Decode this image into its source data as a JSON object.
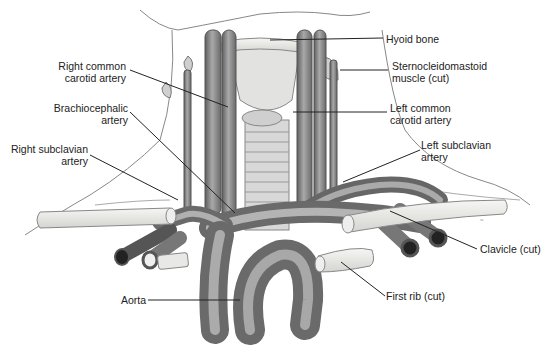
{
  "figure": {
    "labels": {
      "right_common_carotid": [
        "Right common",
        "carotid artery"
      ],
      "brachiocephalic": [
        "Brachiocephalic",
        "artery"
      ],
      "right_subclavian": [
        "Right subclavian",
        "artery"
      ],
      "aorta": [
        "Aorta"
      ],
      "hyoid": [
        "Hyoid bone"
      ],
      "sternocleidomastoid": [
        "Sternocleidomastoid",
        "muscle (cut)"
      ],
      "left_common_carotid": [
        "Left common",
        "carotid artery"
      ],
      "left_subclavian": [
        "Left subclavian",
        "artery"
      ],
      "clavicle": [
        "Clavicle (cut)"
      ],
      "first_rib": [
        "First rib (cut)"
      ]
    },
    "colors": {
      "vessel": "#8a8a8a",
      "vessel_dark": "#5a5a5a",
      "bone": "#ececec",
      "skin_line": "#777777",
      "leader": "#222222",
      "text": "#222222"
    }
  }
}
